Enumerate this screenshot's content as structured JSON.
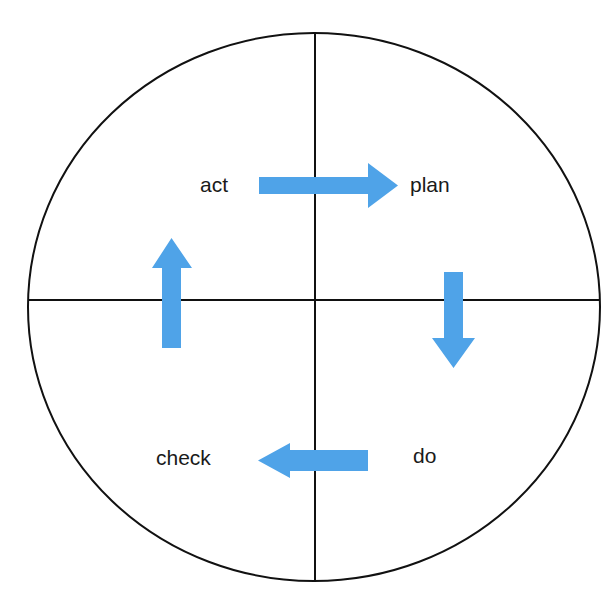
{
  "diagram": {
    "type": "cycle-diagram",
    "shape": "circle-with-crosshair",
    "background_color": "#ffffff",
    "outline_color": "#111111",
    "arrow_color": "#4FA3E8",
    "label_color": "#1a1a1a",
    "circle": {
      "center_x": 314,
      "center_y": 307,
      "radius_x": 286,
      "radius_y": 274
    },
    "axes": {
      "vertical_x": 315,
      "vertical_y1": 33,
      "vertical_y2": 582,
      "horizontal_y": 300,
      "horizontal_x1": 28,
      "horizontal_x2": 600
    },
    "quadrants": [
      {
        "id": "act",
        "label": "act",
        "position": "top-left",
        "label_x": 200,
        "label_y": 192
      },
      {
        "id": "plan",
        "label": "plan",
        "position": "top-right",
        "label_x": 410,
        "label_y": 192
      },
      {
        "id": "check",
        "label": "check",
        "position": "bottom-left",
        "label_x": 156,
        "label_y": 465
      },
      {
        "id": "do",
        "label": "do",
        "position": "bottom-right",
        "label_x": 413,
        "label_y": 463
      }
    ],
    "arrows": [
      {
        "id": "act-to-plan",
        "direction": "right",
        "from": "act",
        "to": "plan",
        "points": "259,177 368,177 368,163 398,185.5 368,208 368,194 259,194"
      },
      {
        "id": "plan-to-do",
        "direction": "down",
        "from": "plan",
        "to": "do",
        "points": "444,272 463,272 463,338 475,338 453.5,368 432,338 444,338"
      },
      {
        "id": "do-to-check",
        "direction": "left",
        "from": "do",
        "to": "check",
        "points": "368,450 290,450 290,443 258,460.5 290,478 290,471 368,471"
      },
      {
        "id": "check-to-act",
        "direction": "up",
        "from": "check",
        "to": "act",
        "points": "162,348 162,268 152,268 171.5,238 192,268 181,268 181,348"
      }
    ]
  }
}
